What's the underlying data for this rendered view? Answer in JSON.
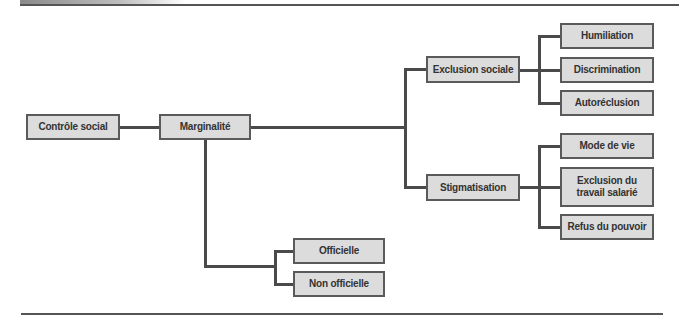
{
  "diagram": {
    "type": "tree",
    "root": {
      "label": "Contrôle social"
    },
    "level1": {
      "label": "Marginalité"
    },
    "branches": {
      "exclusion": {
        "label": "Exclusion sociale",
        "children": [
          "Humiliation",
          "Discrimination",
          "Autoréclusion"
        ]
      },
      "stigmatisation": {
        "label": "Stigmatisation",
        "children": [
          "Mode de vie",
          "Exclusion du travail salarié",
          "Refus du pouvoir"
        ]
      },
      "types": {
        "children": [
          "Officielle",
          "Non officielle"
        ]
      }
    },
    "colors": {
      "box_fill": "#dcdcdc",
      "box_border": "#5a5a5a",
      "connector": "#4a4a4a"
    }
  }
}
